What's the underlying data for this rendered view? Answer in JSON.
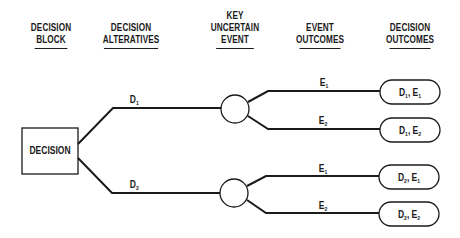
{
  "headers": [
    {
      "id": "decision-block",
      "lines": [
        "DECISION",
        "BLOCK"
      ]
    },
    {
      "id": "decision-alternatives",
      "lines": [
        "DECISION",
        "ALTERATIVES"
      ]
    },
    {
      "id": "key-uncertain-event",
      "lines": [
        "KEY",
        "UNCERTAIN",
        "EVENT"
      ]
    },
    {
      "id": "event-outcomes",
      "lines": [
        "EVENT",
        "OUTCOMES"
      ]
    },
    {
      "id": "decision-outcomes",
      "lines": [
        "DECISION",
        "OUTCOMES"
      ]
    }
  ],
  "decision_box": {
    "label": "DECISION"
  },
  "alternatives": [
    {
      "base": "D",
      "sub": "1"
    },
    {
      "base": "D",
      "sub": "2"
    }
  ],
  "events": [
    {
      "base": "E",
      "sub": "1"
    },
    {
      "base": "E",
      "sub": "2"
    },
    {
      "base": "E",
      "sub": "1"
    },
    {
      "base": "E",
      "sub": "2"
    }
  ],
  "outcomes": [
    {
      "d": "D",
      "d_sub": "1",
      "sep": ", ",
      "e": "E",
      "e_sub": "1"
    },
    {
      "d": "D",
      "d_sub": "1",
      "sep": ", ",
      "e": "E",
      "e_sub": "2"
    },
    {
      "d": "D",
      "d_sub": "2",
      "sep": ", ",
      "e": "E",
      "e_sub": "1"
    },
    {
      "d": "D",
      "d_sub": "2",
      "sep": ", ",
      "e": "E",
      "e_sub": "2"
    }
  ],
  "colors": {
    "ink": "#1a1a1a",
    "background": "#ffffff"
  }
}
